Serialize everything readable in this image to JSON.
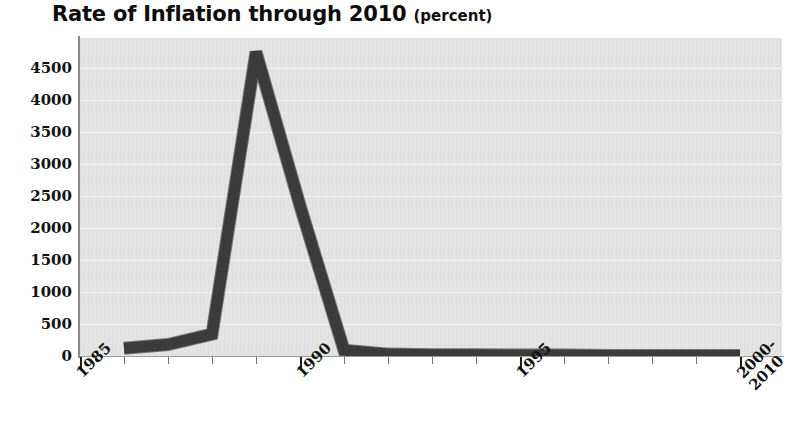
{
  "chart_data": {
    "type": "line",
    "title": "Rate of Inflation through 2010",
    "subtitle": "(percent)",
    "xlabel": "",
    "ylabel": "",
    "grid": true,
    "legend": "none",
    "xlim": [
      1985,
      2000
    ],
    "ylim": [
      0,
      4750
    ],
    "ytick_labels": [
      "4500",
      "4000",
      "3500",
      "3000",
      "2500",
      "2000",
      "1500",
      "1000",
      "500",
      "0"
    ],
    "ytick_values": [
      4500,
      4000,
      3500,
      3000,
      2500,
      2000,
      1500,
      1000,
      500,
      0
    ],
    "xtick_labels": [
      "1985",
      "1990",
      "1995",
      "2000-\n2010"
    ],
    "xtick_values": [
      1985,
      1990,
      1995,
      2000
    ],
    "xtick_minor_values": [
      1986,
      1987,
      1988,
      1989,
      1991,
      1992,
      1993,
      1994,
      1996,
      1997,
      1998,
      1999
    ],
    "note": "Peak near 1989 is clipped at the top of the plot frame",
    "series": [
      {
        "name": "Rate of Inflation",
        "color": "#3b3b3b",
        "x": [
          1986,
          1987,
          1988,
          1989,
          1990,
          1991,
          1992,
          1993,
          1994,
          1995,
          1996,
          1997,
          1998,
          1999,
          2000
        ],
        "values": [
          120,
          180,
          340,
          4750,
          2350,
          90,
          30,
          20,
          20,
          15,
          15,
          10,
          10,
          10,
          10
        ]
      }
    ]
  },
  "colors": {
    "line": "#3b3b3b",
    "plot_background": "#e3e3e3",
    "gridline": "#f4f4f4",
    "axis": "#8a8a8a",
    "text": "#101010",
    "page_background": "#ffffff"
  }
}
